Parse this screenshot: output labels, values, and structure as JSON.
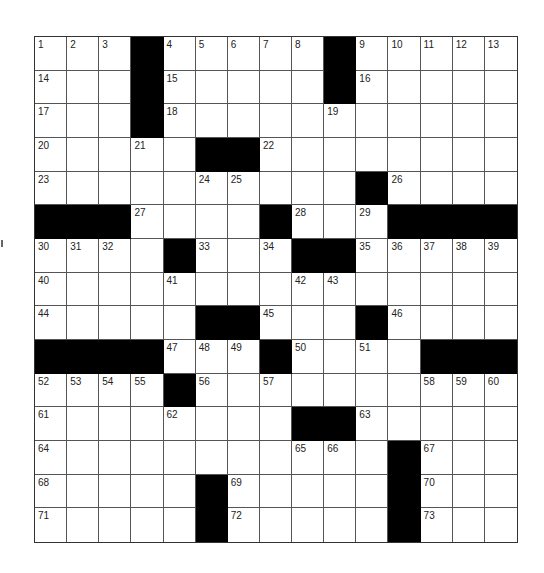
{
  "puzzle": {
    "rows": 15,
    "cols": 15,
    "blocks": [
      [
        3,
        9
      ],
      [
        3,
        9
      ],
      [
        3
      ],
      [
        5,
        6
      ],
      [
        10
      ],
      [
        0,
        1,
        2,
        7,
        11,
        12,
        13,
        14
      ],
      [
        4,
        8,
        9
      ],
      [],
      [
        5,
        6,
        10
      ],
      [
        0,
        1,
        2,
        3,
        7,
        12,
        13,
        14
      ],
      [
        4
      ],
      [
        8,
        9
      ],
      [
        11
      ],
      [
        5,
        11
      ],
      [
        5,
        11
      ]
    ],
    "numbers": [
      {
        "r": 0,
        "c": 0,
        "n": "1"
      },
      {
        "r": 0,
        "c": 1,
        "n": "2"
      },
      {
        "r": 0,
        "c": 2,
        "n": "3"
      },
      {
        "r": 0,
        "c": 4,
        "n": "4"
      },
      {
        "r": 0,
        "c": 5,
        "n": "5"
      },
      {
        "r": 0,
        "c": 6,
        "n": "6"
      },
      {
        "r": 0,
        "c": 7,
        "n": "7"
      },
      {
        "r": 0,
        "c": 8,
        "n": "8"
      },
      {
        "r": 0,
        "c": 10,
        "n": "9"
      },
      {
        "r": 0,
        "c": 11,
        "n": "10"
      },
      {
        "r": 0,
        "c": 12,
        "n": "11"
      },
      {
        "r": 0,
        "c": 13,
        "n": "12"
      },
      {
        "r": 0,
        "c": 14,
        "n": "13"
      },
      {
        "r": 1,
        "c": 0,
        "n": "14"
      },
      {
        "r": 1,
        "c": 4,
        "n": "15"
      },
      {
        "r": 1,
        "c": 10,
        "n": "16"
      },
      {
        "r": 2,
        "c": 0,
        "n": "17"
      },
      {
        "r": 2,
        "c": 4,
        "n": "18"
      },
      {
        "r": 2,
        "c": 9,
        "n": "19"
      },
      {
        "r": 3,
        "c": 0,
        "n": "20"
      },
      {
        "r": 3,
        "c": 3,
        "n": "21"
      },
      {
        "r": 3,
        "c": 7,
        "n": "22"
      },
      {
        "r": 4,
        "c": 0,
        "n": "23"
      },
      {
        "r": 4,
        "c": 5,
        "n": "24"
      },
      {
        "r": 4,
        "c": 6,
        "n": "25"
      },
      {
        "r": 4,
        "c": 11,
        "n": "26"
      },
      {
        "r": 5,
        "c": 3,
        "n": "27"
      },
      {
        "r": 5,
        "c": 8,
        "n": "28"
      },
      {
        "r": 5,
        "c": 10,
        "n": "29"
      },
      {
        "r": 6,
        "c": 0,
        "n": "30"
      },
      {
        "r": 6,
        "c": 1,
        "n": "31"
      },
      {
        "r": 6,
        "c": 2,
        "n": "32"
      },
      {
        "r": 6,
        "c": 5,
        "n": "33"
      },
      {
        "r": 6,
        "c": 7,
        "n": "34"
      },
      {
        "r": 6,
        "c": 10,
        "n": "35"
      },
      {
        "r": 6,
        "c": 11,
        "n": "36"
      },
      {
        "r": 6,
        "c": 12,
        "n": "37"
      },
      {
        "r": 6,
        "c": 13,
        "n": "38"
      },
      {
        "r": 6,
        "c": 14,
        "n": "39"
      },
      {
        "r": 7,
        "c": 0,
        "n": "40"
      },
      {
        "r": 7,
        "c": 4,
        "n": "41"
      },
      {
        "r": 7,
        "c": 8,
        "n": "42"
      },
      {
        "r": 7,
        "c": 9,
        "n": "43"
      },
      {
        "r": 8,
        "c": 0,
        "n": "44"
      },
      {
        "r": 8,
        "c": 7,
        "n": "45"
      },
      {
        "r": 8,
        "c": 11,
        "n": "46"
      },
      {
        "r": 9,
        "c": 4,
        "n": "47"
      },
      {
        "r": 9,
        "c": 5,
        "n": "48"
      },
      {
        "r": 9,
        "c": 6,
        "n": "49"
      },
      {
        "r": 9,
        "c": 8,
        "n": "50"
      },
      {
        "r": 9,
        "c": 10,
        "n": "51"
      },
      {
        "r": 10,
        "c": 0,
        "n": "52"
      },
      {
        "r": 10,
        "c": 1,
        "n": "53"
      },
      {
        "r": 10,
        "c": 2,
        "n": "54"
      },
      {
        "r": 10,
        "c": 3,
        "n": "55"
      },
      {
        "r": 10,
        "c": 5,
        "n": "56"
      },
      {
        "r": 10,
        "c": 7,
        "n": "57"
      },
      {
        "r": 10,
        "c": 12,
        "n": "58"
      },
      {
        "r": 10,
        "c": 13,
        "n": "59"
      },
      {
        "r": 10,
        "c": 14,
        "n": "60"
      },
      {
        "r": 11,
        "c": 0,
        "n": "61"
      },
      {
        "r": 11,
        "c": 4,
        "n": "62"
      },
      {
        "r": 11,
        "c": 10,
        "n": "63"
      },
      {
        "r": 12,
        "c": 0,
        "n": "64"
      },
      {
        "r": 12,
        "c": 8,
        "n": "65"
      },
      {
        "r": 12,
        "c": 9,
        "n": "66"
      },
      {
        "r": 12,
        "c": 12,
        "n": "67"
      },
      {
        "r": 13,
        "c": 0,
        "n": "68"
      },
      {
        "r": 13,
        "c": 6,
        "n": "69"
      },
      {
        "r": 13,
        "c": 12,
        "n": "70"
      },
      {
        "r": 14,
        "c": 0,
        "n": "71"
      },
      {
        "r": 14,
        "c": 6,
        "n": "72"
      },
      {
        "r": 14,
        "c": 12,
        "n": "73"
      }
    ]
  },
  "colors": {
    "block": "#000000",
    "cell": "#ffffff",
    "line": "#555555"
  }
}
